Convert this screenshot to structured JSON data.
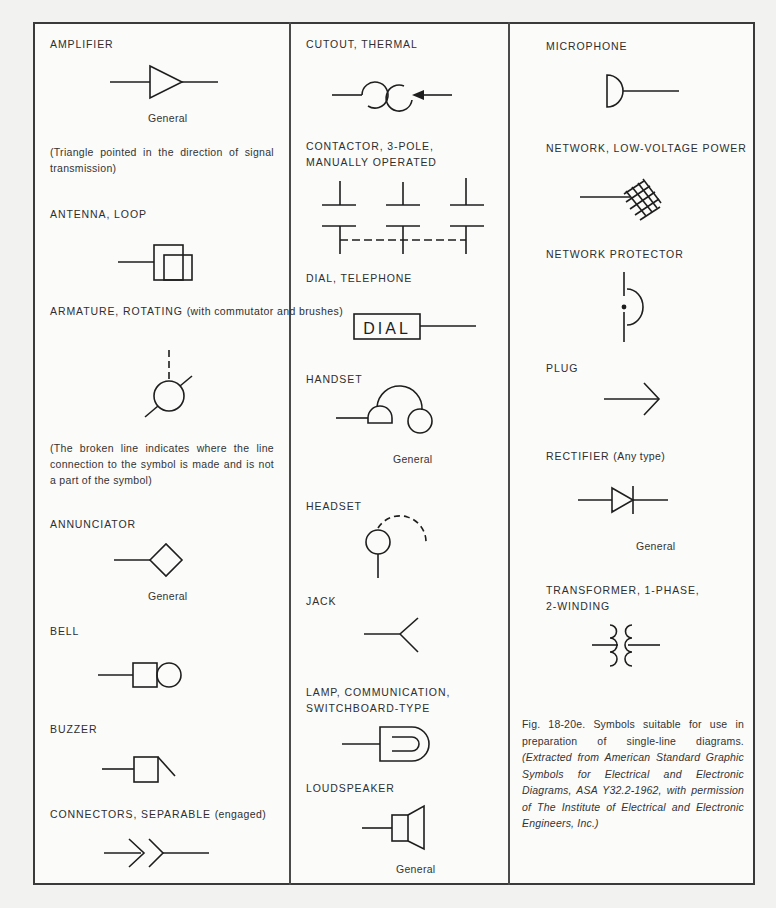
{
  "figure": {
    "caption_lead": "Fig. 18-20e. Symbols suitable for use in preparation of single-line diagrams.",
    "caption_italic": "(Extracted from American Standard Graphic Symbols for Electrical and Electronic Diagrams, ASA Y32.2-1962, with permission of The Institute of Electrical and Electronic Engineers, Inc.)"
  },
  "columns": [
    {
      "symbols": [
        {
          "label": "AMPLIFIER",
          "sublabel": "General",
          "note": "(Triangle pointed in the direction of signal transmission)"
        },
        {
          "label": "ANTENNA, LOOP"
        },
        {
          "label": "ARMATURE, ROTATING",
          "label_suffix": "(with commutator and brushes)",
          "note": "(The broken line indicates where the line connection to the symbol is made and is not a part of the symbol)"
        },
        {
          "label": "ANNUNCIATOR",
          "sublabel": "General"
        },
        {
          "label": "BELL"
        },
        {
          "label": "BUZZER"
        },
        {
          "label": "CONNECTORS, SEPARABLE",
          "label_suffix": "(engaged)"
        }
      ]
    },
    {
      "symbols": [
        {
          "label": "CUTOUT, THERMAL"
        },
        {
          "label_line1": "CONTACTOR, 3-POLE,",
          "label_line2": "MANUALLY OPERATED"
        },
        {
          "label": "DIAL, TELEPHONE",
          "symbol_text": "DIAL"
        },
        {
          "label": "HANDSET",
          "sublabel": "General"
        },
        {
          "label": "HEADSET"
        },
        {
          "label": "JACK"
        },
        {
          "label_line1": "LAMP, COMMUNICATION,",
          "label_line2": "SWITCHBOARD-TYPE"
        },
        {
          "label": "LOUDSPEAKER",
          "sublabel": "General"
        }
      ]
    },
    {
      "symbols": [
        {
          "label": "MICROPHONE"
        },
        {
          "label": "NETWORK, LOW-VOLTAGE POWER"
        },
        {
          "label": "NETWORK PROTECTOR"
        },
        {
          "label": "PLUG"
        },
        {
          "label": "RECTIFIER",
          "label_suffix": "(Any type)",
          "sublabel": "General"
        },
        {
          "label_line1": "TRANSFORMER, 1-PHASE,",
          "label_line2": "2-WINDING"
        }
      ]
    }
  ]
}
